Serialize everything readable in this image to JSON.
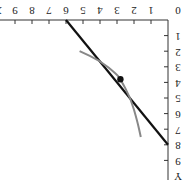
{
  "chart_data": {
    "type": "line",
    "orientation": "rotated 180 degrees",
    "title": "",
    "xlabel": "X",
    "ylabel": "Y",
    "x_ticks": [
      0,
      1,
      2,
      3,
      4,
      5,
      6,
      7,
      8,
      9
    ],
    "y_ticks": [
      1,
      2,
      3,
      4,
      5,
      6,
      7,
      8,
      9
    ],
    "xlim": [
      0,
      10
    ],
    "ylim": [
      0,
      10
    ],
    "series": [
      {
        "name": "budget line",
        "kind": "straight line",
        "color": "#111111",
        "points": [
          [
            6,
            0
          ],
          [
            0,
            8
          ]
        ]
      },
      {
        "name": "indifference curve",
        "kind": "convex curve",
        "color": "#888888",
        "points": [
          [
            5.2,
            2.0
          ],
          [
            4,
            2.6
          ],
          [
            3,
            3.5
          ],
          [
            2.8,
            3.8
          ],
          [
            2.2,
            5
          ],
          [
            1.8,
            6.5
          ],
          [
            1.6,
            7.5
          ]
        ]
      }
    ],
    "annotations": [
      {
        "type": "point",
        "label": "tangency",
        "x": 2.8,
        "y": 3.8
      }
    ]
  },
  "axes": {
    "x_label": "X",
    "y_label": "Y",
    "origin_label": "0"
  }
}
